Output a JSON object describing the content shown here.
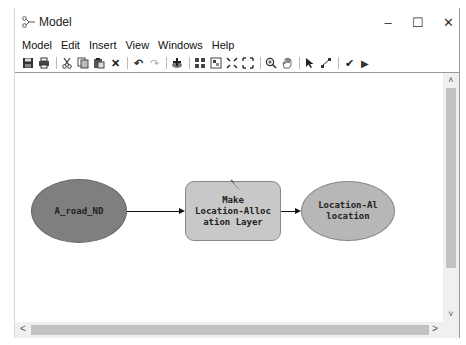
{
  "window": {
    "title": "Model",
    "controls": {
      "minimize": "–",
      "maximize": "☐",
      "close": "✕"
    }
  },
  "menubar": {
    "items": [
      "Model",
      "Edit",
      "Insert",
      "View",
      "Windows",
      "Help"
    ]
  },
  "toolbar": {
    "groups": [
      [
        "save-icon",
        "print-icon"
      ],
      [
        "cut-icon",
        "copy-icon",
        "paste-icon",
        "delete-icon"
      ],
      [
        "undo-icon",
        "redo-icon"
      ],
      [
        "add-data-icon"
      ],
      [
        "auto-layout-icon",
        "full-extent-icon",
        "fixed-zoom-in-icon",
        "fixed-zoom-out-icon"
      ],
      [
        "zoom-in-icon",
        "pan-icon"
      ],
      [
        "select-icon",
        "connect-icon"
      ],
      [
        "validate-icon",
        "run-icon"
      ]
    ],
    "glyphs": {
      "delete": "✕",
      "undo": "↶",
      "redo": "↷",
      "validate": "✔",
      "run": "▶",
      "select": "➤"
    }
  },
  "diagram": {
    "nodes": [
      {
        "id": "input",
        "type": "data-variable",
        "label": "A_road_ND",
        "color": "#7f7f7f"
      },
      {
        "id": "tool",
        "type": "tool",
        "label_lines": [
          "Make",
          "Location-Alloc",
          "ation Layer"
        ],
        "color": "#c8c8c8"
      },
      {
        "id": "output",
        "type": "derived-data",
        "label_lines": [
          "Location-Al",
          "location"
        ],
        "color": "#b7b7b7"
      }
    ],
    "connections": [
      {
        "from": "input",
        "to": "tool"
      },
      {
        "from": "tool",
        "to": "output"
      }
    ]
  },
  "scrollbars": {
    "up": "˄",
    "down": "˅",
    "left": "<",
    "right": ">"
  }
}
